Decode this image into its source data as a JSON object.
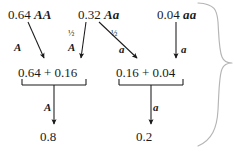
{
  "figure": {
    "ink_color": "#1a1a1a",
    "brace_color": "#b5b5b5",
    "background": "#ffffff"
  },
  "genotypes": [
    {
      "freq": "0.64",
      "symbol": "AA"
    },
    {
      "freq": "0.32",
      "symbol": "Aa"
    },
    {
      "freq": "0.04",
      "symbol": "aa"
    }
  ],
  "edges": [
    {
      "id": "aa-to-A",
      "allele": "A",
      "coefficient": ""
    },
    {
      "id": "Aa-to-A",
      "allele": "A",
      "coefficient": "½"
    },
    {
      "id": "Aa-to-a",
      "allele": "a",
      "coefficient": "½"
    },
    {
      "id": "aaRec-to-a",
      "allele": "a",
      "coefficient": ""
    }
  ],
  "sums": [
    {
      "id": "A-sum",
      "text": "0.64 + 0.16"
    },
    {
      "id": "a-sum",
      "text": "0.16 + 0.04"
    }
  ],
  "bracket_labels": [
    {
      "id": "A-bracket-label",
      "allele": "A"
    },
    {
      "id": "a-bracket-label",
      "allele": "a"
    }
  ],
  "results": [
    {
      "id": "p-result",
      "value": "0.8"
    },
    {
      "id": "q-result",
      "value": "0.2"
    }
  ]
}
